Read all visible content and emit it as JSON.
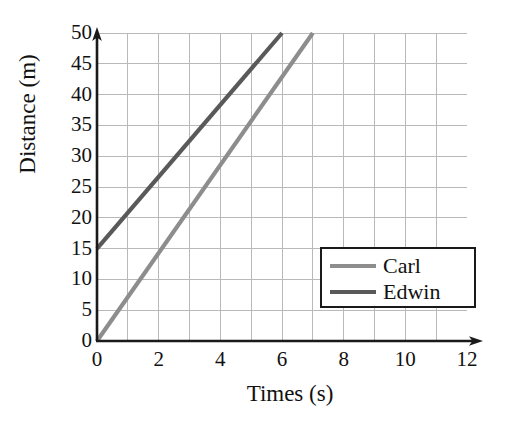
{
  "chart_data": {
    "type": "line",
    "title": "",
    "xlabel": "Times (s)",
    "ylabel": "Distance (m)",
    "xlim": [
      0,
      12
    ],
    "ylim": [
      0,
      50
    ],
    "xticks": [
      0,
      2,
      4,
      6,
      8,
      10,
      12
    ],
    "xtick_labels": [
      "0",
      "2",
      "4",
      "6",
      "8",
      "10",
      "12"
    ],
    "yticks": [
      0,
      5,
      10,
      15,
      20,
      25,
      30,
      35,
      40,
      45,
      50
    ],
    "ytick_labels": [
      "0",
      "5",
      "10",
      "15",
      "20",
      "25",
      "30",
      "35",
      "40",
      "45",
      "50"
    ],
    "grid": true,
    "grid_x_step": 1,
    "grid_y_step": 5,
    "grid_color": "#b9b9b9",
    "axis_color": "#1a1a1a",
    "legend_position": "lower-right-inside",
    "series": [
      {
        "name": "Carl",
        "color": "#8d8d8d",
        "x": [
          0,
          7
        ],
        "y": [
          0,
          50
        ],
        "intercept": 0,
        "slope": 7.14
      },
      {
        "name": "Edwin",
        "color": "#595959",
        "x": [
          0,
          6
        ],
        "y": [
          15,
          50
        ],
        "intercept": 15,
        "slope": 5.83
      }
    ]
  },
  "legend": {
    "entries": [
      {
        "label": "Carl",
        "color": "#8d8d8d"
      },
      {
        "label": "Edwin",
        "color": "#595959"
      }
    ]
  },
  "axis_titles": {
    "x": "Times (s)",
    "y": "Distance (m)"
  }
}
